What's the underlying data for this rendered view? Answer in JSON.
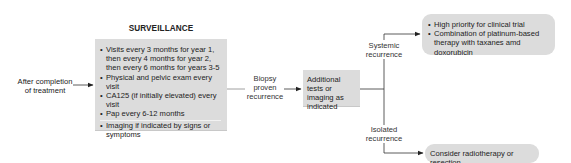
{
  "diagram": {
    "start_label": "After completion of treatment",
    "surveillance": {
      "title": "SURVEILLANCE",
      "items": [
        "Visits every 3 months for year 1, then every 4 months for year 2, then every 6 months for years 3-5",
        "Physical and pelvic exam every visit",
        "CA125 (if initially elevated) every visit",
        "Pap every 6-12 months",
        "Imaging if indicated by signs or symptoms"
      ]
    },
    "biopsy_label": {
      "line1": "Biopsy",
      "line2": "proven",
      "line3": "recurrence"
    },
    "additional_tests": "Additional tests or imaging as indicated",
    "systemic_label": {
      "line1": "Systemic",
      "line2": "recurrence"
    },
    "systemic_box": {
      "items": [
        "High priority for clinical trial",
        "Combination of platinum-based therapy with taxanes amd doxorubicin"
      ]
    },
    "isolated_label": {
      "line1": "Isolated",
      "line2": "recurrence"
    },
    "isolated_box": "Consider radiotherapy or resection",
    "colors": {
      "box_fill": "#dcdcdc",
      "line": "#333333",
      "text": "#222222"
    }
  }
}
